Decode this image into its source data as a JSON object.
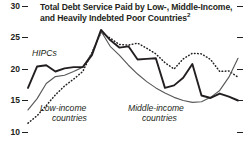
{
  "chart": {
    "title_line1": "Total Debt Service Paid by Low-, Middle-Income,",
    "title_line2": "and Heavily Indebted Poor Countries",
    "title_footnote": "2",
    "labels": {
      "hipcs": "HIPCs",
      "low_income_line1": "Low-income",
      "low_income_line2": "countries",
      "middle_income_line1": "Middle-income",
      "middle_income_line2": "countries"
    },
    "yticks": [
      "30",
      "25",
      "20",
      "15",
      "10"
    ]
  },
  "chart_data": {
    "type": "line",
    "title": "Total Debt Service Paid by Low-, Middle-Income, and Heavily Indebted Poor Countries",
    "xlabel": "",
    "ylabel": "",
    "ylim": [
      10,
      30
    ],
    "yticks": [
      10,
      15,
      20,
      25,
      30
    ],
    "grid": false,
    "legend": "inline-annotations",
    "x": [
      0,
      1,
      2,
      3,
      4,
      5,
      6,
      7,
      8,
      9,
      10,
      11,
      12,
      13,
      14,
      15,
      16,
      17,
      18,
      19,
      20,
      21,
      22,
      23
    ],
    "series": [
      {
        "name": "HIPCs",
        "style": "solid-thick-black",
        "color": "#231f20",
        "values": [
          17.0,
          20.4,
          20.6,
          19.6,
          20.1,
          20.3,
          20.3,
          22.2,
          26.2,
          24.6,
          23.4,
          23.6,
          21.5,
          21.6,
          21.7,
          17.0,
          17.4,
          18.6,
          20.8,
          15.8,
          15.4,
          16.1,
          15.6,
          15.0
        ]
      },
      {
        "name": "Middle-income countries",
        "style": "solid-thin-gray",
        "color": "#58595b",
        "values": [
          13.5,
          15.3,
          17.7,
          18.8,
          19.0,
          19.6,
          20.3,
          22.5,
          26.0,
          23.6,
          22.2,
          20.6,
          19.2,
          18.0,
          17.0,
          16.2,
          15.5,
          15.0,
          14.7,
          14.8,
          15.5,
          16.6,
          18.7,
          21.7
        ]
      },
      {
        "name": "Low-income countries",
        "style": "dotted",
        "color": "#231f20",
        "values": [
          11.4,
          12.6,
          14.2,
          15.9,
          17.3,
          18.4,
          19.6,
          22.6,
          25.8,
          24.9,
          23.9,
          23.8,
          24.1,
          23.3,
          22.4,
          21.0,
          20.0,
          21.6,
          22.5,
          22.4,
          21.5,
          19.6,
          19.7,
          18.7
        ]
      }
    ]
  }
}
